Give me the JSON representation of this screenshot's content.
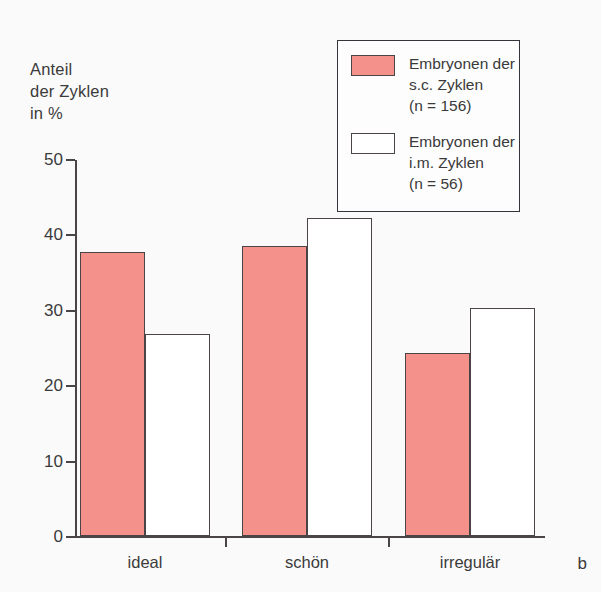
{
  "figure": {
    "panel_letter": "b",
    "background_color": "#fbfafa",
    "axis_color": "#4a4446"
  },
  "axis_title": "Anteil\nder Zyklen\nin %",
  "legend": {
    "entries": [
      {
        "swatch": "sc-swatch",
        "color": "#f4918a",
        "label": "Embryonen der\ns.c. Zyklen\n(n = 156)"
      },
      {
        "swatch": "im-swatch",
        "color": "#ffffff",
        "label": "Embryonen der\ni.m. Zyklen\n(n = 56)"
      }
    ]
  },
  "chart_data": {
    "type": "bar",
    "title": "",
    "xlabel": "",
    "ylabel": "Anteil der Zyklen in %",
    "categories": [
      "ideal",
      "schön",
      "irregulär"
    ],
    "ylim": [
      0,
      50
    ],
    "yticks": [
      0,
      10,
      20,
      30,
      40,
      50
    ],
    "ytick_labels": [
      "0",
      "10",
      "20",
      "30",
      "40",
      "50"
    ],
    "grid": false,
    "legend_position": "top-right",
    "series": [
      {
        "name": "Embryonen der s.c. Zyklen (n = 156)",
        "color": "#f4918a",
        "values": [
          37.7,
          38.5,
          24.3
        ]
      },
      {
        "name": "Embryonen der i.m. Zyklen (n = 56)",
        "color": "#ffffff",
        "values": [
          26.8,
          42.2,
          30.2
        ]
      }
    ]
  }
}
